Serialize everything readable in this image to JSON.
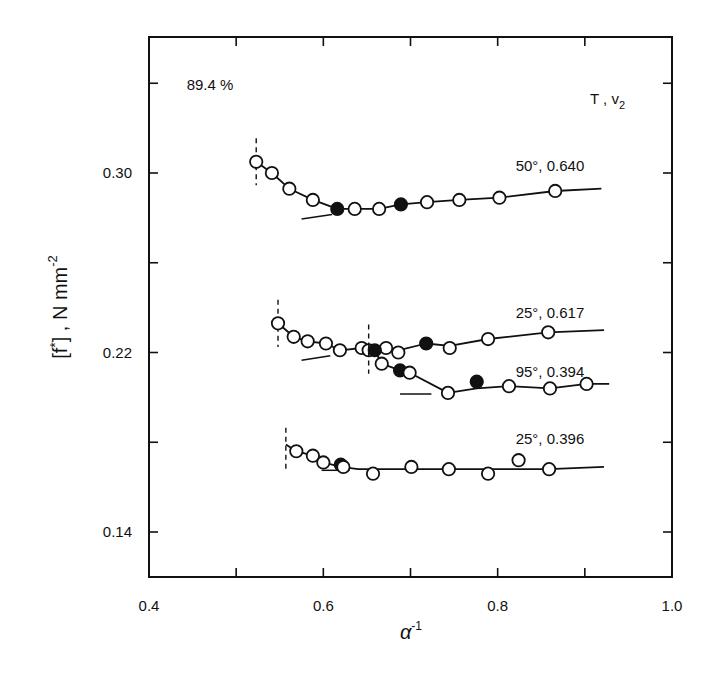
{
  "chart_data": {
    "type": "line",
    "title": "",
    "xlabel": "α⁻¹",
    "xlabel_base": "α",
    "xlabel_sup": "-1",
    "ylabel": "[f*] , N mm⁻²",
    "ylabel_parts": {
      "main": "[f",
      "star": "*",
      "rest": "] , N mm",
      "sup": "-2"
    },
    "xlim": [
      0.4,
      1.0
    ],
    "ylim": [
      0.12,
      0.36
    ],
    "x_ticks": [
      0.4,
      0.5,
      0.6,
      0.7,
      0.8,
      0.9,
      1.0
    ],
    "x_tick_labels": [
      {
        "value": 0.4,
        "label": "0.4"
      },
      {
        "value": 0.6,
        "label": "0.6"
      },
      {
        "value": 0.8,
        "label": "0.8"
      },
      {
        "value": 1.0,
        "label": "1.0"
      }
    ],
    "y_ticks": [
      0.14,
      0.18,
      0.22,
      0.26,
      0.3,
      0.34
    ],
    "y_tick_labels": [
      {
        "value": 0.3,
        "label": "0.30"
      },
      {
        "value": 0.22,
        "label": "0.22"
      },
      {
        "value": 0.14,
        "label": "0.14"
      }
    ],
    "grid": false,
    "legend": {
      "header": "T , v",
      "header_sub": "2",
      "position": "inline-right"
    },
    "annotations": [
      {
        "text": "89.4 %",
        "x": 0.47,
        "y": 0.337
      }
    ],
    "series": [
      {
        "name": "50°, 0.640",
        "label_pos": {
          "x": 0.86,
          "y": 0.301
        },
        "dash_x": 0.523,
        "dash_y": [
          0.3155,
          0.2945
        ],
        "tangent": [
          [
            0.575,
            0.2795
          ],
          [
            0.61,
            0.2815
          ]
        ],
        "line": [
          [
            0.523,
            0.305
          ],
          [
            0.541,
            0.3
          ],
          [
            0.561,
            0.293
          ],
          [
            0.588,
            0.288
          ],
          [
            0.616,
            0.284
          ],
          [
            0.636,
            0.284
          ],
          [
            0.664,
            0.284
          ],
          [
            0.689,
            0.286
          ],
          [
            0.719,
            0.287
          ],
          [
            0.756,
            0.288
          ],
          [
            0.802,
            0.289
          ],
          [
            0.866,
            0.292
          ],
          [
            0.919,
            0.293
          ]
        ],
        "points": [
          {
            "x": 0.523,
            "y": 0.305,
            "filled": false
          },
          {
            "x": 0.541,
            "y": 0.3,
            "filled": false
          },
          {
            "x": 0.561,
            "y": 0.293,
            "filled": false
          },
          {
            "x": 0.588,
            "y": 0.288,
            "filled": false
          },
          {
            "x": 0.616,
            "y": 0.284,
            "filled": true
          },
          {
            "x": 0.636,
            "y": 0.284,
            "filled": false
          },
          {
            "x": 0.664,
            "y": 0.284,
            "filled": false
          },
          {
            "x": 0.689,
            "y": 0.286,
            "filled": true
          },
          {
            "x": 0.719,
            "y": 0.287,
            "filled": false
          },
          {
            "x": 0.756,
            "y": 0.288,
            "filled": false
          },
          {
            "x": 0.802,
            "y": 0.289,
            "filled": false
          },
          {
            "x": 0.866,
            "y": 0.292,
            "filled": false
          }
        ]
      },
      {
        "name": "25°, 0.617",
        "label_pos": {
          "x": 0.86,
          "y": 0.2355
        },
        "dash_x": 0.548,
        "dash_y": [
          0.2435,
          0.2225
        ],
        "tangent": [
          [
            0.575,
            0.2165
          ],
          [
            0.608,
            0.2185
          ]
        ],
        "line": [
          [
            0.548,
            0.233
          ],
          [
            0.566,
            0.227
          ],
          [
            0.582,
            0.225
          ],
          [
            0.603,
            0.224
          ],
          [
            0.619,
            0.221
          ],
          [
            0.644,
            0.222
          ],
          [
            0.652,
            0.221
          ],
          [
            0.672,
            0.222
          ],
          [
            0.686,
            0.221
          ],
          [
            0.718,
            0.224
          ],
          [
            0.745,
            0.223
          ],
          [
            0.789,
            0.226
          ],
          [
            0.858,
            0.229
          ],
          [
            0.922,
            0.23
          ]
        ],
        "points": [
          {
            "x": 0.548,
            "y": 0.233,
            "filled": false
          },
          {
            "x": 0.566,
            "y": 0.227,
            "filled": false
          },
          {
            "x": 0.582,
            "y": 0.225,
            "filled": false
          },
          {
            "x": 0.603,
            "y": 0.224,
            "filled": false
          },
          {
            "x": 0.619,
            "y": 0.221,
            "filled": false
          },
          {
            "x": 0.644,
            "y": 0.222,
            "filled": false
          },
          {
            "x": 0.652,
            "y": 0.221,
            "filled": false
          },
          {
            "x": 0.672,
            "y": 0.222,
            "filled": false
          },
          {
            "x": 0.686,
            "y": 0.22,
            "filled": false
          },
          {
            "x": 0.718,
            "y": 0.224,
            "filled": true
          },
          {
            "x": 0.745,
            "y": 0.222,
            "filled": false
          },
          {
            "x": 0.789,
            "y": 0.226,
            "filled": false
          },
          {
            "x": 0.858,
            "y": 0.229,
            "filled": false
          }
        ]
      },
      {
        "name": "95°, 0.394",
        "label_pos": {
          "x": 0.86,
          "y": 0.209
        },
        "dash_x": 0.652,
        "dash_y": [
          0.2325,
          0.2105
        ],
        "tangent": [
          [
            0.688,
            0.2015
          ],
          [
            0.724,
            0.2015
          ]
        ],
        "line": [
          [
            0.659,
            0.221
          ],
          [
            0.667,
            0.215
          ],
          [
            0.688,
            0.212
          ],
          [
            0.699,
            0.211
          ],
          [
            0.743,
            0.202
          ],
          [
            0.776,
            0.204
          ],
          [
            0.813,
            0.205
          ],
          [
            0.86,
            0.204
          ],
          [
            0.902,
            0.206
          ],
          [
            0.928,
            0.206
          ]
        ],
        "points": [
          {
            "x": 0.659,
            "y": 0.221,
            "filled": true
          },
          {
            "x": 0.667,
            "y": 0.215,
            "filled": false
          },
          {
            "x": 0.688,
            "y": 0.212,
            "filled": true
          },
          {
            "x": 0.699,
            "y": 0.211,
            "filled": false
          },
          {
            "x": 0.743,
            "y": 0.202,
            "filled": false
          },
          {
            "x": 0.776,
            "y": 0.207,
            "filled": true
          },
          {
            "x": 0.813,
            "y": 0.205,
            "filled": false
          },
          {
            "x": 0.86,
            "y": 0.204,
            "filled": false
          },
          {
            "x": 0.902,
            "y": 0.206,
            "filled": false
          }
        ]
      },
      {
        "name": "25°, 0.396",
        "label_pos": {
          "x": 0.86,
          "y": 0.179
        },
        "dash_x": 0.557,
        "dash_y": [
          0.1865,
          0.1675
        ],
        "tangent": [
          [
            0.598,
            0.1675
          ],
          [
            0.63,
            0.1675
          ]
        ],
        "line": [
          [
            0.557,
            0.179
          ],
          [
            0.569,
            0.176
          ],
          [
            0.588,
            0.174
          ],
          [
            0.6,
            0.171
          ],
          [
            0.62,
            0.169
          ],
          [
            0.64,
            0.168
          ],
          [
            0.657,
            0.168
          ],
          [
            0.701,
            0.168
          ],
          [
            0.744,
            0.168
          ],
          [
            0.789,
            0.168
          ],
          [
            0.824,
            0.168
          ],
          [
            0.859,
            0.168
          ],
          [
            0.922,
            0.169
          ]
        ],
        "points": [
          {
            "x": 0.569,
            "y": 0.176,
            "filled": false
          },
          {
            "x": 0.588,
            "y": 0.174,
            "filled": false
          },
          {
            "x": 0.6,
            "y": 0.171,
            "filled": false
          },
          {
            "x": 0.62,
            "y": 0.17,
            "filled": true
          },
          {
            "x": 0.623,
            "y": 0.169,
            "filled": false
          },
          {
            "x": 0.657,
            "y": 0.166,
            "filled": false
          },
          {
            "x": 0.701,
            "y": 0.169,
            "filled": false
          },
          {
            "x": 0.744,
            "y": 0.168,
            "filled": false
          },
          {
            "x": 0.789,
            "y": 0.166,
            "filled": false
          },
          {
            "x": 0.824,
            "y": 0.172,
            "filled": false
          },
          {
            "x": 0.859,
            "y": 0.168,
            "filled": false
          }
        ]
      }
    ],
    "colors": {
      "ink": "#111111",
      "background": "#ffffff"
    }
  }
}
